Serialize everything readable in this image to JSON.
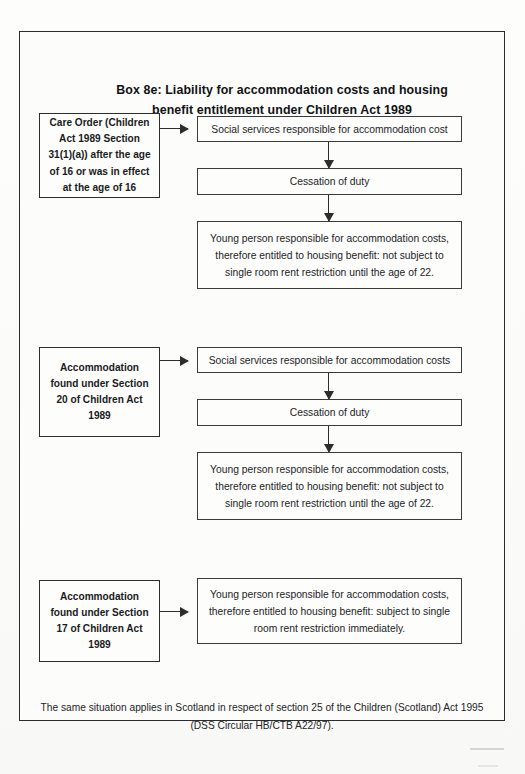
{
  "document": {
    "title_line1": "Box 8e: Liability for accommodation costs and housing",
    "title_line2": "benefit entitlement under Children Act 1989"
  },
  "sections": [
    {
      "id": "section-care-order",
      "source_box": "Care Order (Children Act 1989 Section 31(1)(a)) after the age of 16 or was in effect at the age of 16",
      "steps": [
        "Social services responsible for accommodation cost",
        "Cessation of duty",
        "Young person responsible for accommodation costs, therefore entitled to housing benefit: not subject to single room rent restriction until the age of 22."
      ]
    },
    {
      "id": "section-20",
      "source_box": "Accommodation found under Section 20 of Children Act 1989",
      "steps": [
        "Social services responsible for accommodation costs",
        "Cessation of duty",
        "Young person responsible for accommodation costs, therefore entitled to housing benefit: not subject to single room rent restriction until the age of 22."
      ]
    },
    {
      "id": "section-17",
      "source_box": "Accommodation found under Section 17 of Children Act 1989",
      "steps": [
        "Young person responsible for accommodation costs, therefore entitled to housing benefit: subject to single room rent restriction immediately."
      ]
    }
  ],
  "footnote": {
    "line1": "The same situation applies in Scotland in respect of section 25 of the Children (Scotland) Act 1995",
    "line2": "(DSS Circular HB/CTB A22/97)."
  },
  "colors": {
    "ink": "#17181a",
    "border": "#2c2d2f",
    "paper": "#fcfcfb"
  }
}
